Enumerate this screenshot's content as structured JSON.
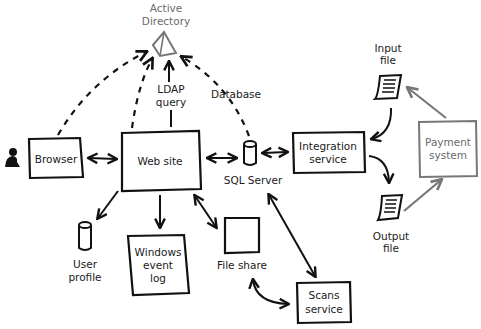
{
  "diagram": {
    "nodes": {
      "active_directory": {
        "label_line1": "Active",
        "label_line2": "Directory"
      },
      "browser": {
        "label": "Browser"
      },
      "web_site": {
        "label": "Web site"
      },
      "sql_server": {
        "label": "SQL Server"
      },
      "integration_service": {
        "label_line1": "Integration",
        "label_line2": "service"
      },
      "input_file": {
        "label_line1": "Input",
        "label_line2": "file"
      },
      "output_file": {
        "label_line1": "Output",
        "label_line2": "file"
      },
      "payment_system": {
        "label_line1": "Payment",
        "label_line2": "system"
      },
      "user_profile": {
        "label_line1": "User",
        "label_line2": "profile"
      },
      "windows_event_log": {
        "label_line1": "Windows",
        "label_line2": "event",
        "label_line3": "log"
      },
      "file_share": {
        "label": "File share"
      },
      "scans_service": {
        "label_line1": "Scans",
        "label_line2": "service"
      }
    },
    "edge_labels": {
      "ldap_query_line1": "LDAP",
      "ldap_query_line2": "query",
      "database": "Database"
    },
    "icons": {
      "user": "person-icon",
      "directory": "pyramid-icon",
      "database": "cylinder-icon",
      "document": "scroll-document-icon"
    },
    "colors": {
      "ink": "#111111",
      "gray_ink": "#777777",
      "background": "#ffffff"
    }
  }
}
